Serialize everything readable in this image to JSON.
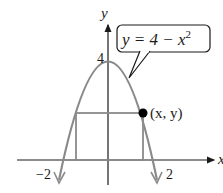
{
  "figure": {
    "equation_label": "y = 4 − x",
    "equation_exponent": "2",
    "point_label": "(x, y)",
    "axis_x_label": "x",
    "axis_y_label": "y",
    "tick_y_4": "4",
    "tick_x_neg2": "−2",
    "tick_x_2": "2",
    "colors": {
      "curve": "#8a8a8a",
      "rectangle": "#8a8a8a",
      "axes": "#1a1a1a",
      "point": "#000000",
      "callout_border": "#1a1a1a"
    }
  }
}
